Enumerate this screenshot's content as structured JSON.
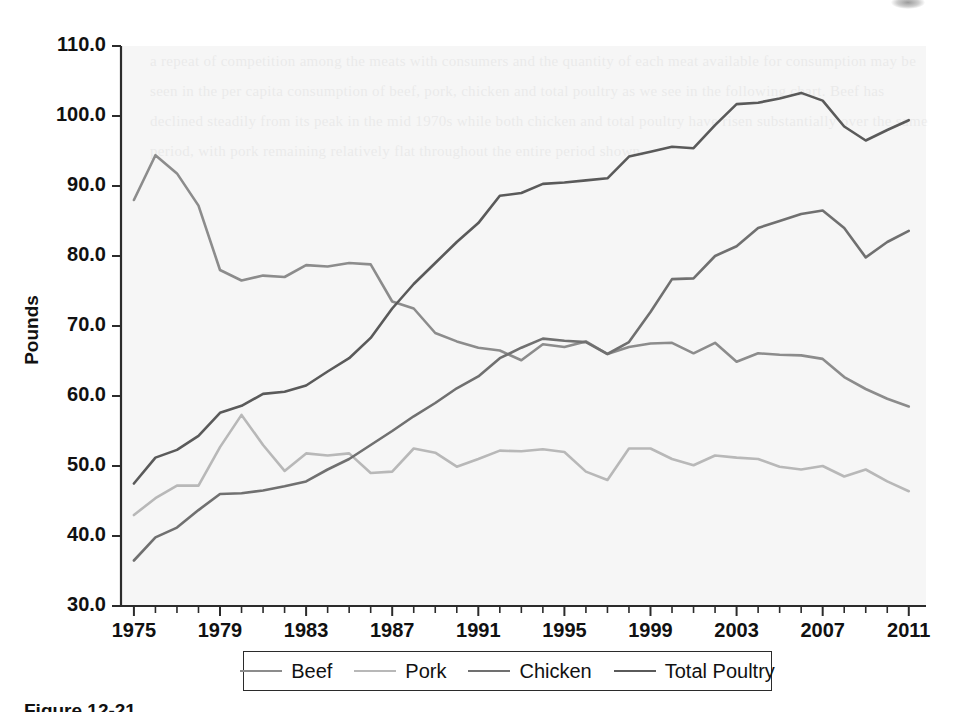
{
  "figure": {
    "caption": "Figure 12-21",
    "background_color": "#f5f5f5",
    "ghost_text": "a repeat of competition among the meats with consumers and the quantity of each meat available for consumption may be seen in the per capita consumption of beef, pork, chicken and total poultry as we see in the following chart. Beef has declined steadily from its peak in the mid 1970s while both chicken and total poultry have risen substantially over the same period, with pork remaining relatively flat throughout the entire period shown."
  },
  "chart_data": {
    "type": "line",
    "title": "",
    "xlabel": "",
    "ylabel": "Pounds",
    "xlim": [
      1974.4,
      2011.8
    ],
    "ylim": [
      30.0,
      110.0
    ],
    "grid": false,
    "legend_position": "bottom",
    "y_ticks": [
      "30.0",
      "40.0",
      "50.0",
      "60.0",
      "70.0",
      "80.0",
      "90.0",
      "100.0",
      "110.0"
    ],
    "y_tick_values": [
      30,
      40,
      50,
      60,
      70,
      80,
      90,
      100,
      110
    ],
    "x_tick_labels": [
      "1975",
      "1979",
      "1983",
      "1987",
      "1991",
      "1995",
      "1999",
      "2003",
      "2007",
      "2011"
    ],
    "x_tick_values": [
      1975,
      1979,
      1983,
      1987,
      1991,
      1995,
      1999,
      2003,
      2007,
      2011
    ],
    "x": [
      1975,
      1976,
      1977,
      1978,
      1979,
      1980,
      1981,
      1982,
      1983,
      1984,
      1985,
      1986,
      1987,
      1988,
      1989,
      1990,
      1991,
      1992,
      1993,
      1994,
      1995,
      1996,
      1997,
      1998,
      1999,
      2000,
      2001,
      2002,
      2003,
      2004,
      2005,
      2006,
      2007,
      2008,
      2009,
      2010,
      2011
    ],
    "series": [
      {
        "name": "Beef",
        "color": "#8c8c8c",
        "values": [
          88.0,
          94.4,
          91.8,
          87.2,
          78.0,
          76.5,
          77.2,
          77.0,
          78.7,
          78.5,
          79.0,
          78.8,
          73.5,
          72.5,
          69.0,
          67.8,
          66.9,
          66.5,
          65.1,
          67.4,
          67.0,
          67.8,
          66.0,
          67.0,
          67.5,
          67.6,
          66.1,
          67.6,
          64.9,
          66.1,
          65.9,
          65.8,
          65.3,
          62.7,
          61.0,
          59.6,
          58.5
        ]
      },
      {
        "name": "Pork",
        "color": "#b8b8b8",
        "values": [
          43.0,
          45.4,
          47.2,
          47.2,
          52.7,
          57.3,
          53.0,
          49.3,
          51.8,
          51.5,
          51.8,
          49.0,
          49.2,
          52.5,
          51.9,
          49.9,
          51.0,
          52.2,
          52.1,
          52.4,
          52.0,
          49.2,
          48.0,
          52.5,
          52.5,
          51.0,
          50.1,
          51.5,
          51.2,
          51.0,
          49.9,
          49.5,
          50.0,
          48.5,
          49.5,
          47.8,
          46.4
        ]
      },
      {
        "name": "Chicken",
        "color": "#707070",
        "values": [
          36.5,
          39.8,
          41.2,
          43.7,
          46.0,
          46.1,
          46.5,
          47.1,
          47.8,
          49.5,
          51.0,
          53.0,
          55.0,
          57.1,
          59.0,
          61.1,
          62.8,
          65.4,
          66.9,
          68.2,
          67.9,
          67.7,
          66.0,
          67.7,
          72.0,
          76.7,
          76.8,
          80.0,
          81.4,
          84.0,
          85.0,
          86.0,
          86.5,
          84.0,
          79.8,
          82.0,
          83.6
        ]
      },
      {
        "name": "Total Poultry",
        "color": "#5a5a5a",
        "values": [
          47.5,
          51.2,
          52.3,
          54.3,
          57.6,
          58.6,
          60.3,
          60.6,
          61.5,
          63.5,
          65.4,
          68.3,
          72.5,
          76.0,
          79.0,
          82.0,
          84.7,
          88.6,
          89.0,
          90.3,
          90.5,
          90.8,
          91.1,
          94.2,
          94.9,
          95.6,
          95.4,
          98.7,
          101.7,
          101.9,
          102.5,
          103.3,
          102.2,
          98.5,
          96.5,
          98.0,
          99.4
        ]
      }
    ]
  },
  "legend": {
    "items": [
      {
        "label": "Beef",
        "color": "#8c8c8c"
      },
      {
        "label": "Pork",
        "color": "#b8b8b8"
      },
      {
        "label": "Chicken",
        "color": "#707070"
      },
      {
        "label": "Total Poultry",
        "color": "#5a5a5a"
      }
    ]
  }
}
